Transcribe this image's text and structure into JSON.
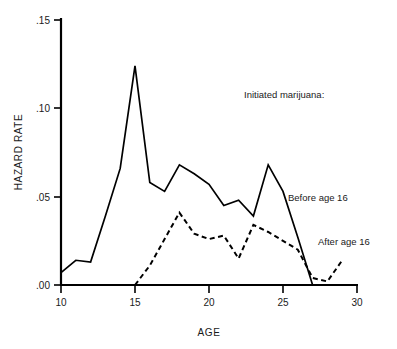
{
  "chart_data": {
    "type": "line",
    "title": "",
    "xlabel": "AGE",
    "ylabel": "HAZARD RATE",
    "xlim": [
      10,
      30
    ],
    "ylim": [
      0.0,
      0.15
    ],
    "grid": false,
    "legend_position": "inline-annotations",
    "x_ticks": [
      "10",
      "15",
      "20",
      "25",
      "30"
    ],
    "x_tick_values": [
      10,
      15,
      20,
      25,
      30
    ],
    "y_ticks": [
      ".00",
      ".05",
      ".10",
      ".15"
    ],
    "y_tick_values": [
      0.0,
      0.05,
      0.1,
      0.15
    ],
    "annotations": [
      {
        "text": "Initiated marijuana:",
        "x": 21.2,
        "y": 0.112
      },
      {
        "text": "Before age 16",
        "x": 26.6,
        "y": 0.052
      },
      {
        "text": "After age 16",
        "x": 28.0,
        "y": 0.022
      }
    ],
    "series": [
      {
        "name": "Before age 16",
        "style": "solid",
        "x": [
          10,
          11,
          12,
          13,
          14,
          15,
          16,
          17,
          18,
          19,
          20,
          21,
          22,
          23,
          24,
          25,
          26,
          27
        ],
        "values": [
          0.007,
          0.014,
          0.013,
          0.039,
          0.066,
          0.124,
          0.058,
          0.053,
          0.068,
          0.063,
          0.057,
          0.045,
          0.048,
          0.039,
          0.068,
          0.053,
          0.027,
          0.0
        ]
      },
      {
        "name": "After age 16",
        "style": "dashed",
        "x": [
          15,
          16,
          17,
          18,
          19,
          20,
          21,
          22,
          23,
          24,
          25,
          26,
          27,
          28,
          29
        ],
        "values": [
          0.0,
          0.011,
          0.026,
          0.041,
          0.029,
          0.026,
          0.028,
          0.015,
          0.034,
          0.03,
          0.025,
          0.02,
          0.004,
          0.002,
          0.014
        ]
      }
    ]
  },
  "figure": {
    "xlabel_text": "AGE",
    "ylabel_text": "HAZARD RATE",
    "legend_header": "Initiated marijuana:",
    "label_before": "Before age 16",
    "label_after": "After age 16"
  }
}
